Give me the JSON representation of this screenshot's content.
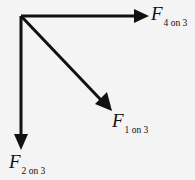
{
  "diagram": {
    "colors": {
      "background": "#f4f4f4",
      "arrow": "#111111",
      "text": "#111111"
    },
    "origin": {
      "x": 21,
      "y": 16
    },
    "vectors": [
      {
        "id": "f4on3",
        "symbol": "F",
        "subscript": "4 on 3",
        "direction": "right",
        "tip": {
          "x": 148,
          "y": 16
        },
        "label_pos": {
          "x": 151,
          "y": 4
        }
      },
      {
        "id": "f1on3",
        "symbol": "F",
        "subscript": "1 on 3",
        "direction": "down-right",
        "tip": {
          "x": 111,
          "y": 110
        },
        "label_pos": {
          "x": 112,
          "y": 112
        }
      },
      {
        "id": "f2on3",
        "symbol": "F",
        "subscript": "2 on 3",
        "direction": "down",
        "tip": {
          "x": 21,
          "y": 150
        },
        "label_pos": {
          "x": 9,
          "y": 152
        }
      }
    ]
  }
}
